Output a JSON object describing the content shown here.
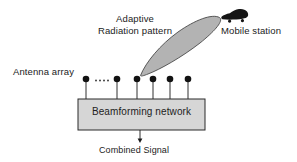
{
  "diagram": {
    "background_color": "#ffffff",
    "line_color": "#1a1a1a",
    "beam_fill_color": "#b0b0b0",
    "box_fill_color": "#d4d4d4",
    "labels": {
      "adaptive_radiation_pattern": "Adaptive\nRadiation pattern",
      "adaptive_line1": "Adaptive",
      "adaptive_line2": "Radiation pattern",
      "mobile_station": "Mobile station",
      "antenna_array": "Antenna array",
      "beamforming_network": "Beamforming network",
      "combined_signal": "Combined Signal"
    },
    "antenna_array": {
      "element_count_visible": 6,
      "ellipsis": ".....",
      "dot_x_positions": [
        86,
        117,
        137,
        153,
        170,
        188
      ],
      "dot_y": 79,
      "dot_radius": 3.2,
      "stem_bottom_y": 99
    },
    "beamforming_box": {
      "x": 78,
      "y": 99,
      "width": 127,
      "height": 31
    },
    "beam_lobe": {
      "tip_x": 140,
      "tip_y": 75,
      "far_x": 221,
      "far_y": 19,
      "max_width": 19
    },
    "combined_signal_arrow": {
      "x": 140,
      "from_y": 130,
      "to_y": 142
    },
    "mobile_station_icon": {
      "shape": "car-silhouette",
      "x": 221,
      "y": 9,
      "width": 27,
      "height": 11,
      "color": "#151515"
    }
  }
}
